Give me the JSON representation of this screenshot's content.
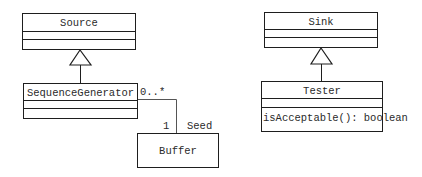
{
  "diagram": {
    "type": "UML class diagram",
    "classes": [
      {
        "id": "source",
        "name": "Source",
        "attributes": [],
        "operations": []
      },
      {
        "id": "sequence_generator",
        "name": "SequenceGenerator",
        "attributes": [],
        "operations": []
      },
      {
        "id": "buffer",
        "name": "Buffer"
      },
      {
        "id": "sink",
        "name": "Sink",
        "attributes": [],
        "operations": []
      },
      {
        "id": "tester",
        "name": "Tester",
        "attributes": [],
        "operations": [
          "isAcceptable(): boolean"
        ]
      }
    ],
    "relationships": [
      {
        "type": "generalization",
        "from": "SequenceGenerator",
        "to": "Source"
      },
      {
        "type": "generalization",
        "from": "Tester",
        "to": "Sink"
      },
      {
        "type": "association",
        "from": "SequenceGenerator",
        "to": "Buffer",
        "from_multiplicity": "0..*",
        "to_multiplicity": "1",
        "role": "Seed"
      }
    ]
  },
  "labels": {
    "source": "Source",
    "sequence_generator": "SequenceGenerator",
    "buffer": "Buffer",
    "sink": "Sink",
    "tester": "Tester",
    "tester_op": "isAcceptable(): boolean",
    "mult_many": "0..*",
    "mult_one": "1",
    "role_seed": "Seed"
  },
  "colors": {
    "line": "#1e1e1e",
    "text": "#2a2a2a",
    "background": "#ffffff"
  }
}
